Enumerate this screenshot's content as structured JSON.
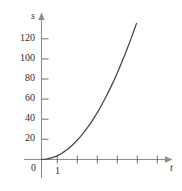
{
  "chart_data": {
    "type": "line",
    "title": "",
    "subtitle": "",
    "xlabel": "t",
    "ylabel": "s",
    "grid": false,
    "legend": null,
    "xlim": [
      -0.35,
      6.0
    ],
    "ylim": [
      -12,
      145
    ],
    "x_ticks": [
      1,
      2,
      3,
      4,
      5,
      6
    ],
    "x_tick_labels": [
      "1",
      "",
      "",
      "",
      "",
      ""
    ],
    "y_ticks": [
      20,
      40,
      60,
      80,
      100,
      120
    ],
    "y_tick_labels": [
      "20",
      "40",
      "60",
      "80",
      "100",
      "120"
    ],
    "origin_label": "0",
    "series": [
      {
        "name": "s(t)",
        "x": [
          0,
          0.25,
          0.5,
          0.75,
          1,
          1.25,
          1.5,
          1.75,
          2,
          2.25,
          2.5,
          2.75,
          3,
          3.25,
          3.5,
          3.75,
          4,
          4.25,
          4.5,
          4.75,
          5,
          5.25,
          5.5,
          5.65
        ],
        "y": [
          0,
          0.4,
          1.5,
          3.4,
          6,
          9.4,
          13.5,
          18.4,
          24,
          30.4,
          37.5,
          45.4,
          54,
          63.4,
          73.5,
          84.4,
          96,
          108.4,
          121.5,
          135.4,
          150,
          165.4,
          181.5,
          190.9
        ]
      }
    ],
    "axis_color": "#8c8c8c",
    "curve_color": "#4a4a4a",
    "text_color": "#2b2b2b"
  },
  "axes": {
    "y_axis_name": "s",
    "x_axis_name": "t",
    "origin": "0"
  },
  "y_labels": [
    {
      "text": "120"
    },
    {
      "text": "100"
    },
    {
      "text": "80"
    },
    {
      "text": "60"
    },
    {
      "text": "40"
    },
    {
      "text": "20"
    }
  ],
  "x_labels": [
    {
      "text": "1"
    }
  ]
}
